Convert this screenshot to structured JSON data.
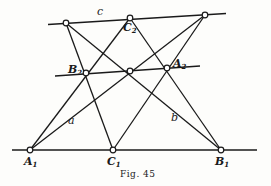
{
  "figure": {
    "caption": "Fig. 45",
    "line_color": "#1a1a1a",
    "background": "#fdfdfb"
  },
  "labels": {
    "c": "c",
    "a": "a",
    "b": "b",
    "C2": {
      "base": "C",
      "sub": "2"
    },
    "B2": {
      "base": "B",
      "sub": "2"
    },
    "A2": {
      "base": "A",
      "sub": "2"
    },
    "A1": {
      "base": "A",
      "sub": "1"
    },
    "C1": {
      "base": "C",
      "sub": "1"
    },
    "B1": {
      "base": "B",
      "sub": "1"
    }
  },
  "points": {
    "P1": [
      66,
      23
    ],
    "C2": [
      130,
      18
    ],
    "P3": [
      205,
      15
    ],
    "B2": [
      86,
      73
    ],
    "M": [
      130,
      71
    ],
    "A2": [
      167,
      68
    ],
    "A1": [
      30,
      150
    ],
    "C1": [
      113,
      150
    ],
    "B1": [
      221,
      150
    ]
  },
  "lines": [
    {
      "name": "line-c",
      "from": [
        48,
        24.5
      ],
      "to": [
        226,
        13.5
      ]
    },
    {
      "name": "line-middle",
      "from": [
        55,
        76
      ],
      "to": [
        200,
        66
      ]
    },
    {
      "name": "line-bottom",
      "from": [
        12,
        150
      ],
      "to": [
        257,
        150
      ]
    },
    {
      "name": "line-A1-C2",
      "from": [
        30,
        150
      ],
      "to": [
        130,
        18
      ]
    },
    {
      "name": "line-a",
      "from": [
        30,
        150
      ],
      "to": [
        205,
        15
      ]
    },
    {
      "name": "line-C1-P1",
      "from": [
        113,
        150
      ],
      "to": [
        66,
        23
      ]
    },
    {
      "name": "line-C1-P3",
      "from": [
        113,
        150
      ],
      "to": [
        205,
        15
      ]
    },
    {
      "name": "line-b",
      "from": [
        221,
        150
      ],
      "to": [
        66,
        23
      ]
    },
    {
      "name": "line-B1-C2",
      "from": [
        221,
        150
      ],
      "to": [
        130,
        18
      ]
    }
  ]
}
